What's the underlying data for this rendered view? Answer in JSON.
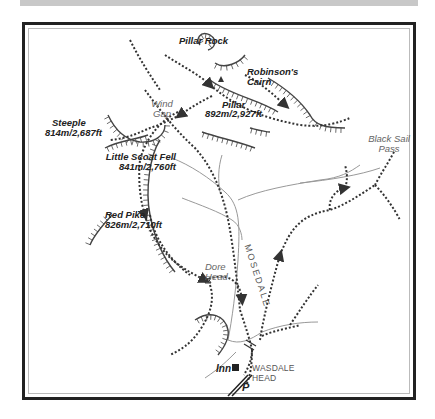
{
  "map": {
    "title": "Pillar walk from Wasdale Head",
    "colors": {
      "frame": "#222222",
      "path": "#333333",
      "stream": "#999999",
      "crag": "#444444",
      "topbar": "#c8c8c8"
    },
    "summits": [
      {
        "name": "Pillar Rock",
        "elevation": ""
      },
      {
        "name": "Robinson's",
        "name2": "Cairn"
      },
      {
        "name": "Pillar",
        "elevation": "892m/2,927ft"
      },
      {
        "name": "Steeple",
        "elevation": "814m/2,687ft"
      },
      {
        "name": "Little Scoat Fell",
        "elevation": "841m/2,760ft"
      },
      {
        "name": "Red Pike",
        "elevation": "826m/2,710ft"
      }
    ],
    "passes": [
      {
        "line1": "Wind",
        "line2": "Gap"
      },
      {
        "line1": "Black Sail",
        "line2": "Pass"
      },
      {
        "line1": "Dore",
        "line2": "Head"
      }
    ],
    "valley": "MOSEDALE",
    "inn": "Inn",
    "village": {
      "line1": "WASDALE",
      "line2": "HEAD"
    },
    "parking": "P"
  }
}
